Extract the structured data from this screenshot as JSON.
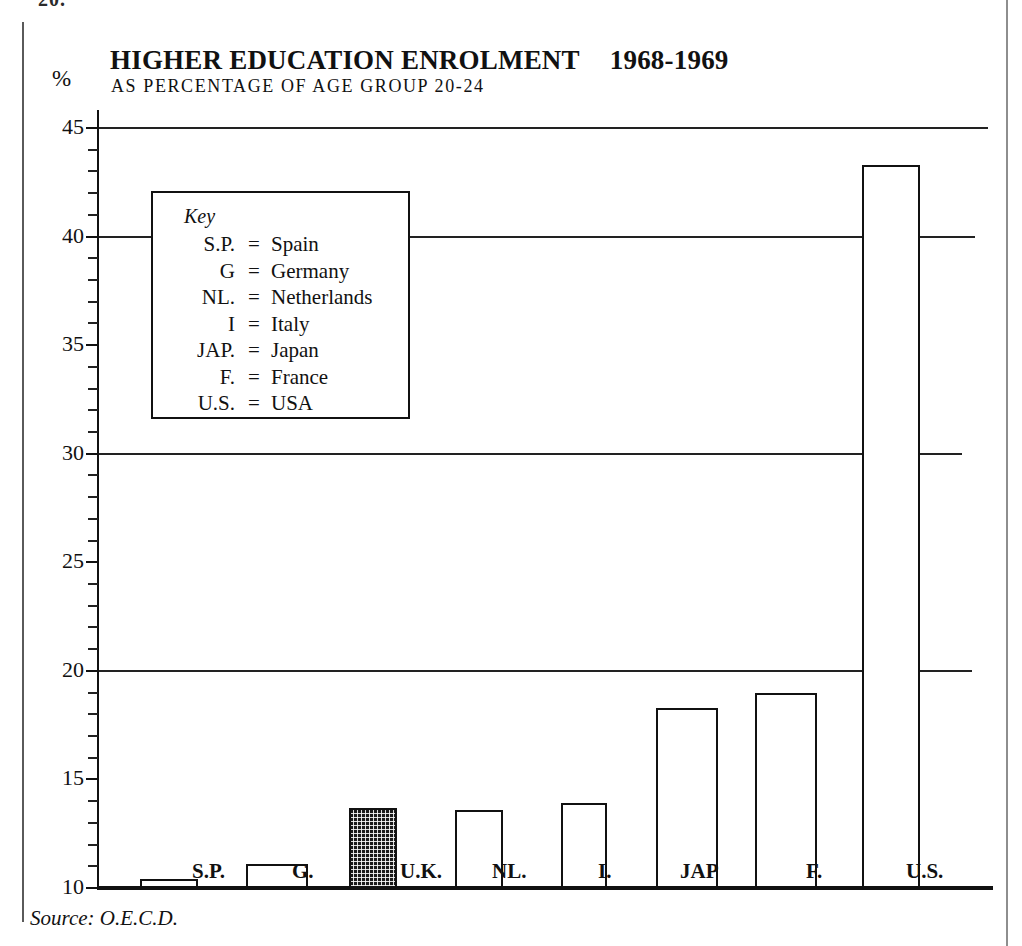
{
  "page": {
    "fragment_text": "20.",
    "source_note": "Source: O.E.C.D."
  },
  "header": {
    "title": "HIGHER EDUCATION ENROLMENT",
    "years": "1968-1969",
    "subtitle": "AS PERCENTAGE OF AGE GROUP 20-24",
    "unit_label": "%"
  },
  "key": {
    "title": "Key",
    "equals": "=",
    "entries": [
      {
        "abbr": "S.P.",
        "name": "Spain"
      },
      {
        "abbr": "G",
        "name": "Germany"
      },
      {
        "abbr": "NL.",
        "name": "Netherlands"
      },
      {
        "abbr": "I",
        "name": "Italy"
      },
      {
        "abbr": "JAP.",
        "name": "Japan"
      },
      {
        "abbr": "F.",
        "name": "France"
      },
      {
        "abbr": "U.S.",
        "name": "USA"
      }
    ]
  },
  "axis": {
    "tick_labels": [
      "45",
      "40",
      "35",
      "30",
      "25",
      "20",
      "15",
      "10"
    ],
    "minor_tick_step": 1
  },
  "chart_data": {
    "type": "bar",
    "subtitle": "AS PERCENTAGE OF AGE GROUP 20-24",
    "xlabel": "",
    "ylabel": "%",
    "ylim": [
      10,
      45
    ],
    "ytick_values": [
      10,
      15,
      20,
      25,
      30,
      35,
      40,
      45
    ],
    "gridlines_at": [
      20,
      30,
      40,
      45
    ],
    "grid": true,
    "legend_position": "inside-upper-left",
    "source": "Source: O.E.C.D.",
    "categories": [
      "S.P.",
      "G.",
      "U.K.",
      "NL.",
      "I.",
      "JAP",
      "F.",
      "U.S."
    ],
    "country_names": [
      "Spain",
      "Germany",
      "United Kingdom",
      "Netherlands",
      "Italy",
      "Japan",
      "France",
      "USA"
    ],
    "values": [
      10.4,
      11.1,
      13.7,
      13.6,
      13.9,
      18.3,
      19.0,
      43.3
    ],
    "highlighted": [
      "U.K."
    ],
    "bars": [
      {
        "label": "S.P.",
        "value": 10.4,
        "style": "outline"
      },
      {
        "label": "G.",
        "value": 11.1,
        "style": "outline"
      },
      {
        "label": "U.K.",
        "value": 13.7,
        "style": "hatched"
      },
      {
        "label": "NL.",
        "value": 13.6,
        "style": "outline"
      },
      {
        "label": "I.",
        "value": 13.9,
        "style": "outline"
      },
      {
        "label": "JAP",
        "value": 18.3,
        "style": "outline"
      },
      {
        "label": "F.",
        "value": 19.0,
        "style": "outline"
      },
      {
        "label": "U.S.",
        "value": 43.3,
        "style": "outline"
      }
    ]
  }
}
